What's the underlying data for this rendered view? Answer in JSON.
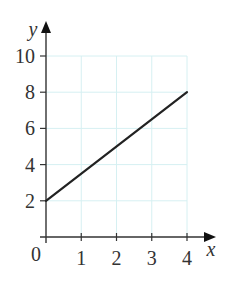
{
  "chart_data": {
    "type": "line",
    "title": "",
    "xlabel": "x",
    "ylabel": "y",
    "xlim": [
      0,
      4
    ],
    "ylim": [
      0,
      10
    ],
    "grid": true,
    "legend": null,
    "x_ticks": [
      0,
      1,
      2,
      3,
      4
    ],
    "y_ticks": [
      2,
      4,
      6,
      8,
      10
    ],
    "x_tick_labels": [
      "1",
      "2",
      "3",
      "4"
    ],
    "y_tick_labels": [
      "2",
      "4",
      "6",
      "8",
      "10"
    ],
    "origin_label": "0",
    "series": [
      {
        "name": "line",
        "x": [
          0,
          4
        ],
        "y": [
          2,
          8
        ]
      }
    ]
  },
  "colors": {
    "grid": "#d6f0f2",
    "axis": "#333333",
    "line": "#222222",
    "text": "#333333"
  }
}
